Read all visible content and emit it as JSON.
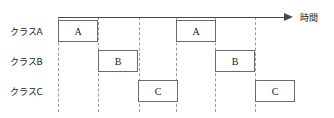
{
  "diagram": {
    "type": "timing-chart",
    "axis": {
      "caption": "時間",
      "arrow_icon": "right-arrow-icon",
      "start_x": 58,
      "end_x": 290,
      "y": 17
    },
    "gridlines": [
      58,
      98,
      139,
      176,
      215,
      255
    ],
    "rows": [
      {
        "id": "class-a",
        "label": "クラスA",
        "label_y": 25,
        "block_top": 20,
        "blocks": [
          {
            "text": "A",
            "x": 58,
            "width": 40
          },
          {
            "text": "A",
            "x": 176,
            "width": 40
          }
        ]
      },
      {
        "id": "class-b",
        "label": "クラスB",
        "label_y": 55,
        "block_top": 50,
        "blocks": [
          {
            "text": "B",
            "x": 98,
            "width": 40
          },
          {
            "text": "B",
            "x": 215,
            "width": 40
          }
        ]
      },
      {
        "id": "class-c",
        "label": "クラスC",
        "label_y": 85,
        "block_top": 80,
        "blocks": [
          {
            "text": "C",
            "x": 138,
            "width": 40
          },
          {
            "text": "C",
            "x": 255,
            "width": 40
          }
        ]
      }
    ],
    "colors": {
      "line": "#4a4a4a",
      "gridline": "#9a9a9a",
      "block_border": "#6b6b6b",
      "text": "#1a1a1a",
      "background": "#ffffff"
    }
  }
}
